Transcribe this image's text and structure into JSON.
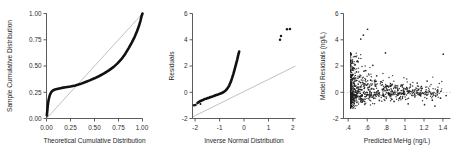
{
  "figure": {
    "background_color": "#ffffff",
    "ink_color": "#111111",
    "reference_line_color": "#8d8d8d",
    "panel_count": 3
  },
  "chart_data": [
    {
      "type": "line",
      "panel": 1,
      "title": "",
      "xlabel": "Theoretical Cumulative Distribution",
      "ylabel": "Sample Cumulative Distribution",
      "xlim": [
        0.0,
        1.0
      ],
      "ylim": [
        0.0,
        1.0
      ],
      "grid": false,
      "legend": "none",
      "xticks": [
        "0.00",
        "0.25",
        "0.50",
        "0.75",
        "1.00"
      ],
      "xtick_values": [
        0.0,
        0.25,
        0.5,
        0.75,
        1.0
      ],
      "yticks": [
        "0.00",
        "0.25",
        "0.50",
        "0.75",
        "1.00"
      ],
      "ytick_values": [
        0.0,
        0.25,
        0.5,
        0.75,
        1.0
      ],
      "series": [
        {
          "name": "Empirical P-P curve",
          "style": "thick-band",
          "x": [
            0.005,
            0.008,
            0.012,
            0.018,
            0.025,
            0.035,
            0.05,
            0.07,
            0.09,
            0.12,
            0.16,
            0.2,
            0.25,
            0.3,
            0.35,
            0.4,
            0.45,
            0.5,
            0.55,
            0.6,
            0.65,
            0.7,
            0.74,
            0.78,
            0.82,
            0.86,
            0.89,
            0.92,
            0.945,
            0.965,
            0.98,
            0.99,
            1.0
          ],
          "y": [
            0.035,
            0.075,
            0.115,
            0.155,
            0.19,
            0.225,
            0.252,
            0.268,
            0.276,
            0.283,
            0.291,
            0.297,
            0.305,
            0.315,
            0.328,
            0.345,
            0.363,
            0.383,
            0.405,
            0.43,
            0.458,
            0.492,
            0.525,
            0.565,
            0.615,
            0.675,
            0.725,
            0.78,
            0.835,
            0.885,
            0.935,
            0.975,
            1.0
          ]
        },
        {
          "name": "45-degree reference line",
          "style": "thin-line",
          "x": [
            0.0,
            1.0
          ],
          "y": [
            0.0,
            1.0
          ]
        }
      ],
      "annotations": [
        {
          "text": "isolated low point near origin",
          "x": 0.005,
          "y": 0.035
        }
      ]
    },
    {
      "type": "scatter",
      "panel": 2,
      "title": "",
      "xlabel": "Inverse Normal Distribution",
      "ylabel": "Residuals",
      "xlim": [
        -2.1,
        2.1
      ],
      "ylim": [
        -2.0,
        6.0
      ],
      "grid": false,
      "legend": "none",
      "xticks": [
        "-2",
        "-1",
        "0",
        "1",
        "2"
      ],
      "xtick_values": [
        -2,
        -1,
        0,
        1,
        2
      ],
      "yticks": [
        "-2",
        "0",
        "2",
        "4",
        "6"
      ],
      "ytick_values": [
        -2,
        0,
        2,
        4,
        6
      ],
      "series": [
        {
          "name": "Normal Q-Q curve",
          "style": "thick-band",
          "x": [
            -1.8,
            -1.7,
            -1.6,
            -1.5,
            -1.4,
            -1.3,
            -1.2,
            -1.1,
            -1.0,
            -0.85,
            -0.7,
            -0.55,
            -0.4,
            -0.25,
            -0.1,
            0.05,
            0.2,
            0.35,
            0.5,
            0.65,
            0.8,
            0.95,
            1.05,
            1.15,
            1.25,
            1.35,
            1.45,
            1.55,
            1.62
          ],
          "y": [
            -0.88,
            -0.8,
            -0.74,
            -0.7,
            -0.66,
            -0.62,
            -0.58,
            -0.55,
            -0.52,
            -0.47,
            -0.42,
            -0.37,
            -0.32,
            -0.27,
            -0.22,
            -0.17,
            -0.11,
            -0.04,
            0.06,
            0.22,
            0.45,
            0.78,
            1.05,
            1.35,
            1.7,
            2.05,
            2.4,
            2.8,
            3.05
          ]
        },
        {
          "name": "Low-tail outliers",
          "style": "points",
          "x": [
            -2.0,
            -1.88
          ],
          "y": [
            -1.0,
            -0.98
          ]
        },
        {
          "name": "High-tail outliers",
          "style": "points",
          "x": [
            1.66,
            1.7,
            1.83,
            1.93
          ],
          "y": [
            4.0,
            4.3,
            4.8,
            4.82
          ]
        },
        {
          "name": "45-degree reference line",
          "style": "thin-line",
          "x": [
            -2.1,
            2.1
          ],
          "y": [
            -1.85,
            2.0
          ]
        }
      ]
    },
    {
      "type": "scatter",
      "panel": 3,
      "title": "",
      "xlabel": "Predicted MeHg (ng/L)",
      "ylabel": "Model Residuals (ng/L)",
      "xlim": [
        0.35,
        1.48
      ],
      "ylim": [
        -2.0,
        6.0
      ],
      "grid": false,
      "legend": "none",
      "xticks": [
        ".4",
        ".6",
        ".8",
        "1",
        "1.2",
        "1.4"
      ],
      "xtick_values": [
        0.4,
        0.6,
        0.8,
        1.0,
        1.2,
        1.4
      ],
      "yticks": [
        "-2",
        "0",
        "2",
        "4",
        "6"
      ],
      "ytick_values": [
        -2,
        0,
        2,
        4,
        6
      ],
      "reference_lines": [
        {
          "name": "zero residual line",
          "orientation": "horizontal",
          "y": 0,
          "style": "dashed",
          "color": "#9b9b9b"
        }
      ],
      "series": [
        {
          "name": "Model residuals vs predicted MeHg",
          "style": "points",
          "marker": "dot",
          "point_count_approx": 900,
          "description": "Dense wedge of points clustered at low predicted values (0.42-0.55) spanning residuals -1 to +2.5, thinning rightward toward residuals near 0; scattered high outliers near 4-4.8 at predicted 0.5-0.65 and a lone point near 2.9 at predicted 1.4.",
          "x": [
            0.425,
            0.428,
            0.43,
            0.432,
            0.435,
            0.437,
            0.44,
            0.442,
            0.445,
            0.447,
            0.45,
            0.452,
            0.455,
            0.457,
            0.46,
            0.462,
            0.465,
            0.468,
            0.47,
            0.473,
            0.476,
            0.48,
            0.483,
            0.487,
            0.49,
            0.495,
            0.5,
            0.505,
            0.51,
            0.515,
            0.52,
            0.526,
            0.532,
            0.538,
            0.545,
            0.552,
            0.56,
            0.568,
            0.576,
            0.585,
            0.594,
            0.604,
            0.614,
            0.625,
            0.636,
            0.648,
            0.66,
            0.673,
            0.686,
            0.7,
            0.714,
            0.729,
            0.744,
            0.76,
            0.776,
            0.793,
            0.81,
            0.828,
            0.846,
            0.865,
            0.884,
            0.904,
            0.924,
            0.945,
            0.966,
            0.988,
            1.01,
            1.033,
            1.056,
            1.08,
            1.104,
            1.129,
            1.154,
            1.18,
            1.206,
            1.233,
            1.26,
            1.288,
            1.316,
            1.345,
            1.374,
            1.404,
            1.434
          ],
          "y": [
            0.05,
            -0.12,
            0.3,
            -0.05,
            0.6,
            0.18,
            -0.3,
            0.95,
            0.42,
            -0.18,
            1.35,
            0.08,
            -0.45,
            0.7,
            1.8,
            0.25,
            -0.22,
            1.05,
            0.52,
            2.1,
            0.15,
            -0.38,
            0.88,
            1.55,
            0.33,
            -0.1,
            2.35,
            0.62,
            0.05,
            -0.52,
            1.2,
            0.4,
            4.05,
            0.18,
            -0.28,
            0.75,
            4.35,
            0.3,
            -0.15,
            1.65,
            0.55,
            4.8,
            0.2,
            -0.4,
            0.92,
            0.28,
            2.05,
            -0.18,
            0.48,
            1.25,
            0.1,
            -0.62,
            0.8,
            0.22,
            -0.3,
            3.0,
            0.45,
            -0.15,
            0.65,
            0.08,
            -0.7,
            0.35,
            0.18,
            -0.42,
            0.55,
            -0.08,
            0.25,
            -0.88,
            0.4,
            0.12,
            -0.35,
            0.7,
            -0.2,
            0.3,
            -0.95,
            0.85,
            0.05,
            -0.6,
            -1.05,
            0.18,
            -0.45,
            2.9,
            -0.25
          ]
        }
      ]
    }
  ]
}
